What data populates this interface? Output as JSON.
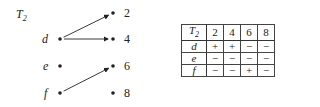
{
  "title": {
    "letter": "T",
    "subscript": "2"
  },
  "domain_elements": [
    "d",
    "e",
    "f"
  ],
  "codomain_elements": [
    "2",
    "4",
    "6",
    "8"
  ],
  "arrows": [
    {
      "from": "d",
      "to": "2"
    },
    {
      "from": "d",
      "to": "4"
    },
    {
      "from": "f",
      "to": "6"
    }
  ],
  "table": {
    "corner": {
      "letter": "T",
      "subscript": "2"
    },
    "columns": [
      "2",
      "4",
      "6",
      "8"
    ],
    "rows": [
      {
        "label": "d",
        "cells": [
          "+",
          "+",
          "−",
          "−"
        ]
      },
      {
        "label": "e",
        "cells": [
          "−",
          "−",
          "−",
          "−"
        ]
      },
      {
        "label": "f",
        "cells": [
          "−",
          "−",
          "+",
          "−"
        ]
      }
    ]
  }
}
